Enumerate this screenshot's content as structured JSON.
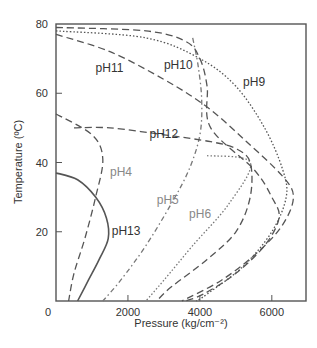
{
  "chart_data": {
    "type": "line",
    "title": "",
    "xlabel": "Pressure (kg/cm⁻²)",
    "ylabel": "Temperature (ºC)",
    "xlim": [
      0,
      6950
    ],
    "ylim": [
      0,
      80
    ],
    "x_ticks": [
      0,
      2000,
      4000,
      6000
    ],
    "y_ticks": [
      0,
      20,
      40,
      60,
      80
    ],
    "x_tick_labels": [
      "0",
      "2000",
      "4000",
      "6000"
    ],
    "y_tick_labels": [
      "0",
      "20",
      "40",
      "60",
      "80"
    ],
    "grid": false,
    "legend": "inline labels",
    "series": [
      {
        "name": "pH4",
        "style": "dashed",
        "color": "#555555",
        "points": [
          [
            0,
            54
          ],
          [
            1000,
            48
          ],
          [
            1300,
            41
          ],
          [
            1100,
            30
          ],
          [
            800,
            18
          ],
          [
            500,
            8
          ],
          [
            350,
            0
          ]
        ]
      },
      {
        "name": "pH5",
        "style": "dash-dot",
        "color": "#777777",
        "points": [
          [
            3800,
            76
          ],
          [
            3950,
            68
          ],
          [
            4050,
            58
          ],
          [
            4000,
            48
          ],
          [
            3700,
            38
          ],
          [
            3200,
            28
          ],
          [
            2500,
            16
          ],
          [
            1800,
            6
          ],
          [
            1300,
            0
          ]
        ]
      },
      {
        "name": "pH6",
        "style": "dotted",
        "color": "#777777",
        "points": [
          [
            4200,
            42
          ],
          [
            5400,
            40
          ],
          [
            4800,
            28
          ],
          [
            3800,
            16
          ],
          [
            3000,
            6
          ],
          [
            2500,
            0
          ]
        ]
      },
      {
        "name": "pH9",
        "style": "dotted",
        "color": "#555555",
        "points": [
          [
            0,
            78
          ],
          [
            2500,
            76
          ],
          [
            4000,
            70
          ],
          [
            5000,
            62
          ],
          [
            5800,
            50
          ],
          [
            6300,
            38
          ],
          [
            6400,
            30
          ],
          [
            6000,
            20
          ],
          [
            5200,
            10
          ],
          [
            4200,
            2
          ],
          [
            3900,
            0
          ]
        ]
      },
      {
        "name": "pH10",
        "style": "dashed",
        "color": "#555555",
        "points": [
          [
            0,
            79
          ],
          [
            2500,
            78
          ],
          [
            3600,
            75
          ],
          [
            4000,
            70
          ],
          [
            4200,
            62
          ],
          [
            4300,
            50
          ],
          [
            5500,
            38
          ],
          [
            6000,
            30
          ],
          [
            6200,
            24
          ],
          [
            5800,
            16
          ],
          [
            5000,
            8
          ],
          [
            4100,
            2
          ],
          [
            3600,
            0
          ]
        ]
      },
      {
        "name": "pH11",
        "style": "dashed",
        "color": "#555555",
        "points": [
          [
            0,
            77
          ],
          [
            1500,
            72
          ],
          [
            3000,
            64
          ],
          [
            4200,
            56
          ],
          [
            5300,
            46
          ],
          [
            6300,
            36
          ],
          [
            6600,
            30
          ],
          [
            6300,
            22
          ],
          [
            5600,
            14
          ],
          [
            4600,
            6
          ],
          [
            3500,
            0
          ]
        ]
      },
      {
        "name": "pH12",
        "style": "dashed",
        "color": "#555555",
        "points": [
          [
            500,
            50
          ],
          [
            1500,
            50
          ],
          [
            3000,
            48
          ],
          [
            4300,
            46
          ],
          [
            5000,
            44
          ],
          [
            5400,
            40
          ],
          [
            5400,
            30
          ],
          [
            5000,
            20
          ],
          [
            4200,
            12
          ],
          [
            3200,
            4
          ],
          [
            2800,
            0
          ]
        ]
      },
      {
        "name": "pH13",
        "style": "solid",
        "color": "#555555",
        "points": [
          [
            0,
            37
          ],
          [
            600,
            35
          ],
          [
            1100,
            30
          ],
          [
            1400,
            24
          ],
          [
            1450,
            18
          ],
          [
            1200,
            12
          ],
          [
            900,
            6
          ],
          [
            600,
            0
          ]
        ]
      }
    ],
    "annotations": [
      {
        "text": "pH11",
        "x": 1100,
        "y": 66
      },
      {
        "text": "pH10",
        "x": 3000,
        "y": 67
      },
      {
        "text": "pH9",
        "x": 5200,
        "y": 62
      },
      {
        "text": "pH12",
        "x": 2600,
        "y": 47
      },
      {
        "text": "pH4",
        "x": 1500,
        "y": 36
      },
      {
        "text": "pH5",
        "x": 2800,
        "y": 28
      },
      {
        "text": "pH6",
        "x": 3700,
        "y": 24
      },
      {
        "text": "pH13",
        "x": 1550,
        "y": 19
      }
    ]
  }
}
